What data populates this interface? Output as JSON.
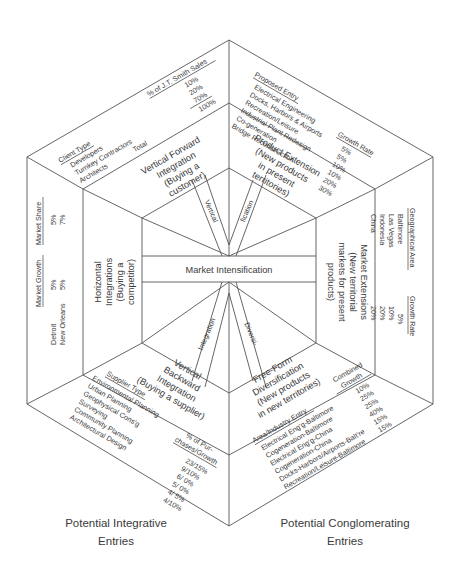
{
  "diagram": {
    "center": "Market Intensification",
    "spokes": {
      "upper_left": "Vertical",
      "upper_right": "fication",
      "lower_left": "Integration",
      "lower_right": "Diversi-"
    },
    "strategies": {
      "top_left": [
        "Vertical Forward",
        "Integration",
        "(Buying a",
        "customer)"
      ],
      "top_right": [
        "Product Extension",
        "(New products",
        "in present",
        "territories)"
      ],
      "right": [
        "Market Extensions",
        "(New territorial",
        "markets for present",
        "products)"
      ],
      "bottom_right": [
        "Free-Form",
        "Diversification",
        "(New products",
        "in new territories)"
      ],
      "bottom_left": [
        "Vertical",
        "Backward",
        "Integration",
        "(Buying a supplier)"
      ],
      "left": [
        "Horizontal",
        "Integrations",
        "(Buying a",
        "competitor)"
      ]
    },
    "panels": {
      "top_left": {
        "header_left": "Client Type",
        "header_right": "% of J.T. Smith Sales",
        "items": [
          "Developers",
          "Turnkey Contractors",
          "Architects"
        ],
        "values": [
          "10%",
          "20%",
          "70%"
        ],
        "total_label": "Total",
        "total_value": "100%"
      },
      "top_right": {
        "header_left": "Proposed Entry",
        "header_right": "Growth Rate",
        "items": [
          "Electrical Engineering",
          "Docks, Harbors & Airports",
          "Recreation/Leisure",
          "Industrial Plant Redesign",
          "Co-generation",
          "Bridge Reconstruction"
        ],
        "values": [
          "5%",
          "5%",
          "10%",
          "10%",
          "20%",
          "30%"
        ]
      },
      "right": {
        "header_left": "Geographical Area",
        "header_right": "Growth Rate",
        "items": [
          "Baltimore",
          "Las Vegas",
          "Indonesia",
          "China"
        ],
        "values": [
          "5%",
          "10%",
          "20%",
          "20%"
        ]
      },
      "bottom_right": {
        "header_left": "Area/Industry Entry",
        "header_right": [
          "Combined",
          "Growth"
        ],
        "items": [
          "Electrical Eng'g-Baltimore",
          "Cogeneration-Baltimore",
          "Electrical Eng'g-China",
          "Cogeneration-China",
          "Docks-Harbors/Airports-Balt're",
          "Recreation/Leisure-Baltimore"
        ],
        "values": [
          "10%",
          "25%",
          "25%",
          "40%",
          "15%",
          "15%"
        ]
      },
      "bottom_left": {
        "header_left": "Supplier Type",
        "header_right": [
          "% of Pur-",
          "chases/Growth"
        ],
        "items": [
          "Environmental Planning",
          "Urban Planning",
          "Geophysical Cons'g",
          "Surveying",
          "Community Planning",
          "Architectural Design"
        ],
        "values": [
          "23/15%",
          "9/10%",
          "6/ 0%",
          "5/ 0%",
          "4/ 5%",
          "4/10%"
        ]
      },
      "left": {
        "header_market_growth": "Market Growth",
        "header_market_share": "Market Share",
        "items": [
          "Detroit",
          "New Orleans"
        ],
        "growth_values": [
          "5%",
          "5%"
        ],
        "share_values": [
          "5%",
          "7%"
        ]
      }
    },
    "captions": {
      "left": [
        "Potential Integrative",
        "Entries"
      ],
      "right": [
        "Potential Conglomerating",
        "Entries"
      ]
    }
  }
}
